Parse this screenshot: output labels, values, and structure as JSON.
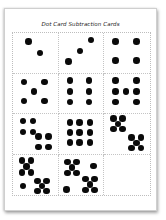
{
  "document": {
    "title": "Dot Card Subtraction Cards"
  },
  "colors": {
    "dot": "#0a0a0a",
    "grid_line": "#c4c4c4",
    "page": "#ffffff"
  },
  "cards": [
    {
      "count": 2,
      "dots": [
        [
          35,
          22
        ],
        [
          60,
          50
        ]
      ]
    },
    {
      "count": 3,
      "dots": [
        [
          72,
          18
        ],
        [
          48,
          45
        ],
        [
          22,
          72
        ]
      ]
    },
    {
      "count": 4,
      "dots": [
        [
          25,
          22
        ],
        [
          70,
          22
        ],
        [
          25,
          70
        ],
        [
          70,
          70
        ]
      ]
    },
    {
      "count": 5,
      "dots": [
        [
          25,
          22
        ],
        [
          70,
          22
        ],
        [
          47,
          45
        ],
        [
          25,
          70
        ],
        [
          70,
          70
        ]
      ]
    },
    {
      "count": 6,
      "dots": [
        [
          25,
          18
        ],
        [
          68,
          18
        ],
        [
          25,
          45
        ],
        [
          68,
          45
        ],
        [
          25,
          72
        ],
        [
          68,
          72
        ]
      ]
    },
    {
      "count": 7,
      "dots": [
        [
          25,
          18
        ],
        [
          70,
          18
        ],
        [
          25,
          45
        ],
        [
          47,
          45
        ],
        [
          70,
          45
        ],
        [
          25,
          72
        ],
        [
          70,
          72
        ]
      ]
    },
    {
      "count": 8,
      "dots": [
        [
          22,
          18
        ],
        [
          45,
          18
        ],
        [
          22,
          45
        ],
        [
          45,
          45
        ],
        [
          57,
          57
        ],
        [
          80,
          57
        ],
        [
          57,
          83
        ],
        [
          80,
          83
        ]
      ]
    },
    {
      "count": 9,
      "dots": [
        [
          25,
          22
        ],
        [
          47,
          22
        ],
        [
          70,
          22
        ],
        [
          25,
          47
        ],
        [
          47,
          47
        ],
        [
          70,
          47
        ],
        [
          25,
          72
        ],
        [
          47,
          72
        ],
        [
          70,
          72
        ]
      ]
    },
    {
      "count": 10,
      "dots": [
        [
          20,
          12
        ],
        [
          40,
          12
        ],
        [
          30,
          25
        ],
        [
          20,
          38
        ],
        [
          40,
          38
        ],
        [
          60,
          60
        ],
        [
          80,
          60
        ],
        [
          70,
          73
        ],
        [
          60,
          86
        ],
        [
          80,
          86
        ]
      ]
    },
    {
      "count": 11,
      "dots": [
        [
          20,
          15
        ],
        [
          40,
          15
        ],
        [
          30,
          30
        ],
        [
          20,
          45
        ],
        [
          40,
          45
        ],
        [
          22,
          78
        ],
        [
          55,
          65
        ],
        [
          75,
          65
        ],
        [
          65,
          78
        ],
        [
          55,
          90
        ],
        [
          75,
          90
        ]
      ]
    },
    {
      "count": 12,
      "dots": [
        [
          20,
          18
        ],
        [
          40,
          18
        ],
        [
          30,
          32
        ],
        [
          20,
          46
        ],
        [
          40,
          46
        ],
        [
          78,
          28
        ],
        [
          18,
          86
        ],
        [
          60,
          60
        ],
        [
          80,
          60
        ],
        [
          70,
          74
        ],
        [
          60,
          88
        ],
        [
          80,
          88
        ]
      ]
    },
    {
      "count": 0,
      "dots": []
    }
  ]
}
